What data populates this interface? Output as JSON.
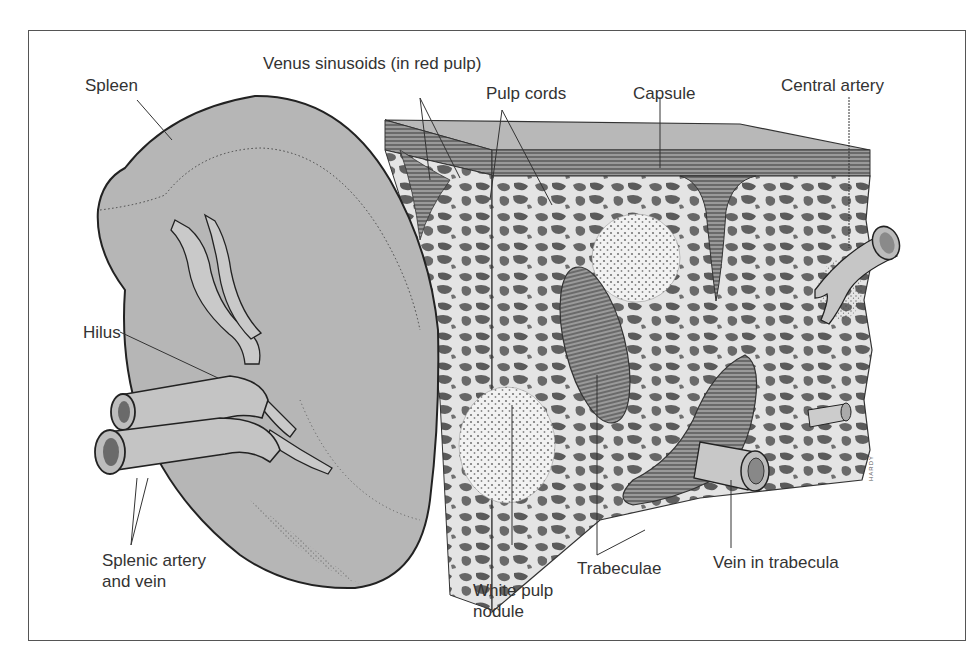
{
  "figure": {
    "labels": {
      "spleen": "Spleen",
      "venus_sinusoids": "Venus sinusoids (in red pulp)",
      "pulp_cords": "Pulp cords",
      "capsule": "Capsule",
      "central_artery": "Central artery",
      "hilus": "Hilus",
      "splenic_artery_vein": "Splenic artery\nand vein",
      "white_pulp_nodule": "White pulp\nnodule",
      "trabeculae": "Trabeculae",
      "vein_in_trabecula": "Vein in trabecula"
    },
    "artist_signature": "HARDY",
    "colors": {
      "organ_fill": "#b4b4b4",
      "red_pulp_background": "#e6e6e6",
      "tissue_mesh": "#5a5a5a",
      "outline": "#222222",
      "frame": "#555555",
      "label_text": "#333333"
    }
  }
}
